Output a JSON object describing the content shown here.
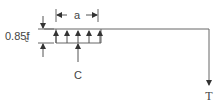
{
  "diagram": {
    "type": "stress-block",
    "labels": {
      "depth": "a",
      "stress_main": "0.85f",
      "stress_prime": "′",
      "stress_sub": "c",
      "compression": "C",
      "tension": "T"
    },
    "colors": {
      "line": "#555555",
      "text": "#444444"
    }
  }
}
